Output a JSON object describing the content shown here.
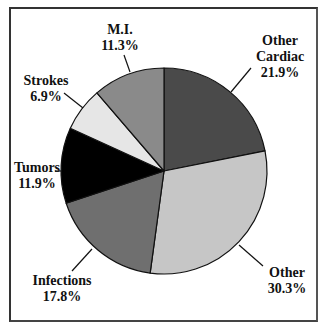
{
  "chart_data": {
    "type": "pie",
    "title": "",
    "start_angle_deg": 0,
    "direction": "clockwise",
    "center": [
      164,
      171
    ],
    "radius": 103,
    "slices": [
      {
        "name": "Other Cardiac",
        "label_lines": [
          "Other",
          "Cardiac"
        ],
        "value": 21.9,
        "value_label": "21.9%",
        "color": "#4a4a4a"
      },
      {
        "name": "Other",
        "label_lines": [
          "Other"
        ],
        "value": 30.3,
        "value_label": "30.3%",
        "color": "#c6c6c6"
      },
      {
        "name": "Infections",
        "label_lines": [
          "Infections"
        ],
        "value": 17.8,
        "value_label": "17.8%",
        "color": "#6f6f6f"
      },
      {
        "name": "Tumors",
        "label_lines": [
          "Tumors"
        ],
        "value": 11.9,
        "value_label": "11.9%",
        "color": "#000000"
      },
      {
        "name": "Strokes",
        "label_lines": [
          "Strokes"
        ],
        "value": 6.9,
        "value_label": "6.9%",
        "color": "#e6e6e6"
      },
      {
        "name": "M.I.",
        "label_lines": [
          "M.I."
        ],
        "value": 11.3,
        "value_label": "11.3%",
        "color": "#8a8a8a"
      }
    ],
    "legend": "none",
    "grid": false
  },
  "labels": {
    "mi": {
      "line1": "M.I.",
      "value": "11.3%"
    },
    "other_cardiac": {
      "line1": "Other",
      "line2": "Cardiac",
      "value": "21.9%"
    },
    "strokes": {
      "line1": "Strokes",
      "value": "6.9%"
    },
    "tumors": {
      "line1": "Tumors",
      "value": "11.9%"
    },
    "infections": {
      "line1": "Infections",
      "value": "17.8%"
    },
    "other": {
      "line1": "Other",
      "value": "30.3%"
    }
  }
}
